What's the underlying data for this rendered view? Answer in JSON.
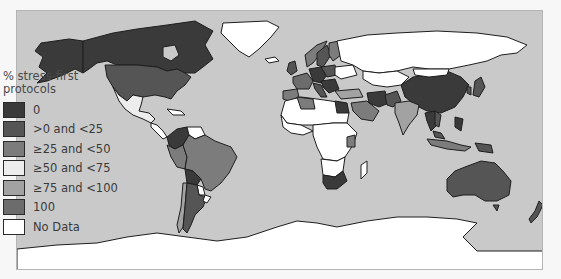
{
  "map": {
    "ocean_color": "#c9c9c9",
    "border_color": "#1e1e1e"
  },
  "legend": {
    "title": "% stress-first protocols",
    "items": [
      {
        "label": "0",
        "color": "#3a3a3a"
      },
      {
        "label": ">0 and <25",
        "color": "#555555"
      },
      {
        "label": "≥25 and <50",
        "color": "#7c7c7c"
      },
      {
        "label": "≥50 and <75",
        "color": "#ededed"
      },
      {
        "label": "≥75 and <100",
        "color": "#a2a2a2"
      },
      {
        "label": "100",
        "color": "#6c6c6c"
      },
      {
        "label": "No Data",
        "color": "#ffffff"
      }
    ]
  }
}
